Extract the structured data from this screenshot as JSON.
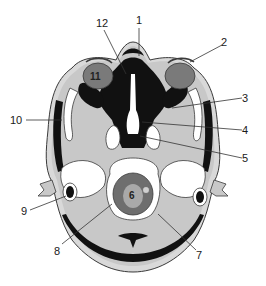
{
  "diagram": {
    "type": "anatomical-axial-section",
    "colors": {
      "soft_tissue": "#c8c8c8",
      "bone": "#ffffff",
      "air_dark": "#111111",
      "outline": "#3a3a3a",
      "globe": "#7a7a7a",
      "brainstem_outer": "#6e6e6e",
      "brainstem_inner": "#a9a9a9",
      "skin": "#d9d9d9"
    },
    "labels": [
      {
        "id": "1",
        "text": "1",
        "x": 139,
        "y": 24
      },
      {
        "id": "2",
        "text": "2",
        "x": 224,
        "y": 47
      },
      {
        "id": "3",
        "text": "3",
        "x": 245,
        "y": 101
      },
      {
        "id": "4",
        "text": "4",
        "x": 245,
        "y": 134
      },
      {
        "id": "5",
        "text": "5",
        "x": 245,
        "y": 162
      },
      {
        "id": "6",
        "text": "6",
        "x": 133,
        "y": 198
      },
      {
        "id": "7",
        "text": "7",
        "x": 200,
        "y": 257
      },
      {
        "id": "8",
        "text": "8",
        "x": 57,
        "y": 251
      },
      {
        "id": "9",
        "text": "9",
        "x": 24,
        "y": 214
      },
      {
        "id": "10",
        "text": "10",
        "x": 12,
        "y": 124
      },
      {
        "id": "11",
        "text": "11",
        "x": 97,
        "y": 80
      },
      {
        "id": "12",
        "text": "12",
        "x": 99,
        "y": 27
      }
    ]
  }
}
